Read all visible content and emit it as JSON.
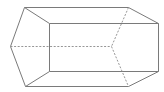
{
  "figure": {
    "type": "pentagonal-prism",
    "stroke_color": "#7a7a7a",
    "hidden_color": "#8a8a8a",
    "background": "#ffffff",
    "vertices": {
      "A": [
        24,
        7
      ],
      "B": [
        49,
        23
      ],
      "C": [
        49,
        71
      ],
      "D": [
        25,
        86
      ],
      "E": [
        10,
        46
      ],
      "A2": [
        128,
        7
      ],
      "B2": [
        158,
        23
      ],
      "C2": [
        158,
        71
      ],
      "D2": [
        128,
        86
      ],
      "E2": [
        111,
        46
      ]
    },
    "visible_edges": [
      [
        "A",
        "B"
      ],
      [
        "B",
        "C"
      ],
      [
        "C",
        "D"
      ],
      [
        "D",
        "E"
      ],
      [
        "E",
        "A"
      ],
      [
        "A",
        "A2"
      ],
      [
        "B",
        "B2"
      ],
      [
        "C",
        "C2"
      ],
      [
        "D",
        "D2"
      ],
      [
        "A2",
        "B2"
      ],
      [
        "B2",
        "C2"
      ],
      [
        "C2",
        "D2"
      ]
    ],
    "hidden_edges": [
      [
        "E",
        "E2"
      ],
      [
        "A2",
        "E2"
      ],
      [
        "E2",
        "D2"
      ]
    ]
  }
}
